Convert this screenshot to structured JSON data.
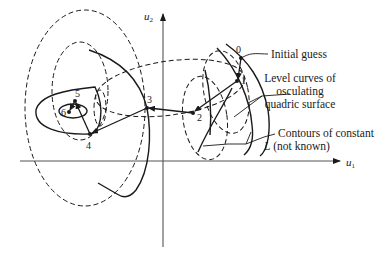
{
  "figure": {
    "type": "optimization-iteration-diagram",
    "axes": {
      "x_label": "u",
      "x_subscript": "1",
      "y_label": "u",
      "y_subscript": "2"
    },
    "points": [
      {
        "id": "0",
        "label": "0"
      },
      {
        "id": "1",
        "label": "1"
      },
      {
        "id": "2",
        "label": "2"
      },
      {
        "id": "3",
        "label": "3"
      },
      {
        "id": "4",
        "label": "4"
      },
      {
        "id": "5",
        "label": "5"
      },
      {
        "id": "6",
        "label": "6"
      }
    ],
    "annotations": {
      "initial_guess": "Initial guess",
      "level_curves_line1": "Level curves of",
      "level_curves_line2": "osculating",
      "level_curves_line3": "quadric surface",
      "contours_line1": "Contours of constant",
      "contours_line2_var": "L",
      "contours_line2_rest": " (not known)"
    },
    "legend": {
      "dashed": "Level curves of osculating quadric surface",
      "solid": "Contours of constant L (not known)"
    },
    "colors": {
      "ink": "#1a1a1a",
      "background": "#ffffff",
      "axis": "#555555"
    }
  }
}
